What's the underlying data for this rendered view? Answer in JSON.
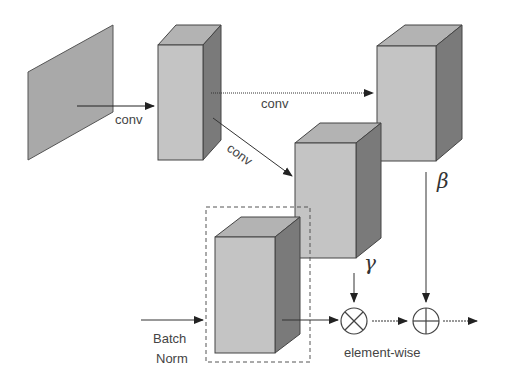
{
  "diagram": {
    "labels": {
      "conv_input": "conv",
      "conv_beta": "conv",
      "conv_gamma": "conv",
      "beta": "β",
      "gamma": "γ",
      "batch_norm_line1": "Batch",
      "batch_norm_line2": "Norm",
      "element_wise": "element-wise"
    },
    "operators": {
      "multiply": "⊗",
      "add": "⊕"
    },
    "nodes": [
      {
        "id": "input-map",
        "shape": "plane"
      },
      {
        "id": "shared-feature",
        "shape": "block"
      },
      {
        "id": "beta-block",
        "shape": "block"
      },
      {
        "id": "gamma-block",
        "shape": "block"
      },
      {
        "id": "normalized-activation",
        "shape": "block",
        "boxed": true
      }
    ],
    "colors": {
      "front": "#c4c4c4",
      "top": "#b3b3b3",
      "side": "#7a7a7a",
      "plane": "#a9a9a9",
      "stroke": "#444444",
      "arrow": "#222222"
    }
  }
}
